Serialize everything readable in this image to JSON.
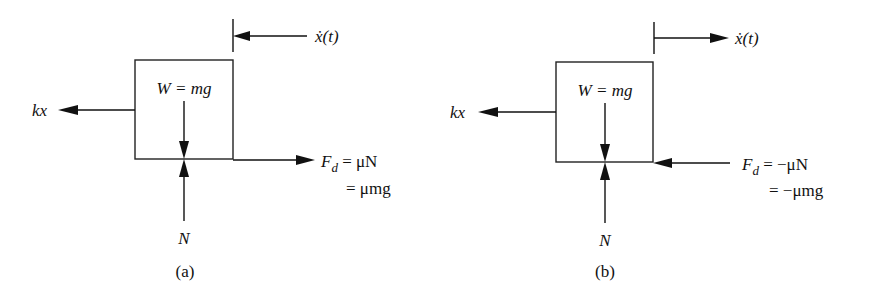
{
  "diagram": {
    "panels": [
      {
        "id": "a",
        "caption": "(a)",
        "velocity_label": "ẋ(t)",
        "velocity_direction": "left",
        "spring_force_label": "kx",
        "weight_label": "W = mg",
        "normal_label": "N",
        "friction_force": {
          "symbol": "F",
          "subscript": "d",
          "line1": " = μN",
          "line2": "= μmg",
          "direction": "right"
        }
      },
      {
        "id": "b",
        "caption": "(b)",
        "velocity_label": "ẋ(t)",
        "velocity_direction": "right",
        "spring_force_label": "kx",
        "weight_label": "W = mg",
        "normal_label": "N",
        "friction_force": {
          "symbol": "F",
          "subscript": "d",
          "line1": " = −μN",
          "line2": "= −μmg",
          "direction": "left"
        }
      }
    ]
  }
}
